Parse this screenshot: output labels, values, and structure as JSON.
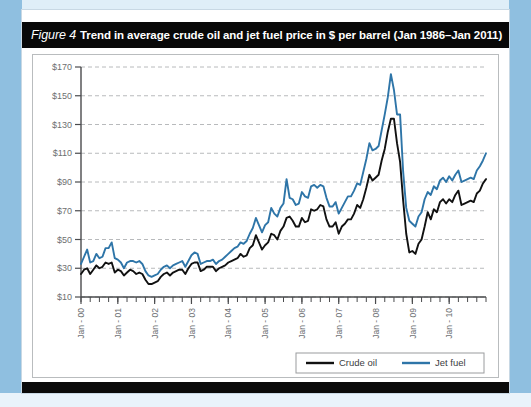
{
  "figure": {
    "number_label": "Figure 4",
    "title": "Trend in average crude oil and jet fuel price in $ per barrel (Jan 1986–Jan 2011)"
  },
  "colors": {
    "crude_oil": "#111111",
    "jet_fuel": "#2e75a8",
    "gridline": "#b8babc",
    "axis": "#4a4b4d",
    "tick_text": "#6d6f71",
    "header_band": "#080808",
    "page_background": "#8fbfe0"
  },
  "legend": {
    "position": "bottom-right",
    "entries": [
      {
        "name": "crude-oil",
        "label": "Crude oil",
        "color": "#111111"
      },
      {
        "name": "jet-fuel",
        "label": "Jet fuel",
        "color": "#2e75a8"
      }
    ]
  },
  "chart_data": {
    "type": "line",
    "title": "Trend in average crude oil and jet fuel price in $ per barrel (Jan 1986–Jan 2011)",
    "xlabel": "",
    "ylabel": "",
    "ylim": [
      10,
      170
    ],
    "ytick_values": [
      10,
      30,
      50,
      70,
      90,
      110,
      130,
      150,
      170
    ],
    "ytick_labels": [
      "$10",
      "$30",
      "$50",
      "$70",
      "$90",
      "$110",
      "$130",
      "$150",
      "$170"
    ],
    "grid": true,
    "grid_style": "dashed-horizontal",
    "x_start": "Jan-00",
    "x_end": "Jan-11",
    "x_step_months": 3,
    "xtick_labels": [
      "Jan - 00",
      "Jan - 01",
      "Jan - 02",
      "Jan - 03",
      "Jan - 04",
      "Jan - 05",
      "Jan - 06",
      "Jan - 07",
      "Jan - 08",
      "Jan - 09",
      "Jan - 10"
    ],
    "xtick_index": [
      0,
      12,
      24,
      36,
      48,
      60,
      72,
      84,
      96,
      108,
      120
    ],
    "x_months": 133,
    "series": [
      {
        "name": "Crude oil",
        "color": "#111111",
        "values": [
          26,
          29,
          30,
          26,
          29,
          32,
          30,
          31,
          34,
          33,
          34,
          27,
          29,
          28,
          25,
          27,
          29,
          28,
          26,
          27,
          26,
          22,
          19,
          19,
          20,
          21,
          24,
          26,
          27,
          25,
          27,
          28,
          29,
          29,
          26,
          30,
          33,
          34,
          34,
          28,
          29,
          31,
          31,
          31,
          28,
          30,
          31,
          32,
          34,
          35,
          36,
          37,
          40,
          38,
          39,
          44,
          46,
          53,
          48,
          43,
          46,
          48,
          54,
          53,
          50,
          56,
          59,
          65,
          66,
          63,
          59,
          59,
          65,
          62,
          63,
          71,
          70,
          71,
          74,
          73,
          64,
          59,
          59,
          62,
          54,
          59,
          61,
          64,
          64,
          68,
          74,
          72,
          78,
          86,
          95,
          91,
          93,
          95,
          105,
          113,
          125,
          134,
          134,
          117,
          104,
          77,
          54,
          41,
          42,
          40,
          47,
          50,
          59,
          69,
          64,
          71,
          69,
          76,
          78,
          75,
          78,
          76,
          81,
          84,
          74,
          75,
          76,
          77,
          76,
          82,
          84,
          89,
          92
        ]
      },
      {
        "name": "Jet fuel",
        "color": "#2e75a8",
        "values": [
          33,
          38,
          43,
          34,
          35,
          40,
          37,
          38,
          44,
          44,
          48,
          37,
          36,
          34,
          30,
          34,
          35,
          35,
          34,
          35,
          33,
          28,
          25,
          24,
          25,
          26,
          29,
          31,
          32,
          30,
          32,
          33,
          34,
          35,
          31,
          35,
          39,
          41,
          40,
          33,
          34,
          35,
          35,
          36,
          33,
          35,
          36,
          38,
          40,
          42,
          44,
          45,
          48,
          47,
          49,
          54,
          58,
          65,
          60,
          55,
          60,
          62,
          72,
          68,
          66,
          72,
          75,
          92,
          79,
          78,
          74,
          75,
          83,
          80,
          79,
          87,
          88,
          86,
          88,
          87,
          79,
          73,
          73,
          76,
          68,
          72,
          76,
          80,
          80,
          84,
          89,
          88,
          97,
          106,
          117,
          112,
          113,
          115,
          126,
          137,
          149,
          165,
          154,
          137,
          137,
          97,
          72,
          63,
          61,
          59,
          66,
          69,
          78,
          83,
          81,
          87,
          85,
          91,
          93,
          90,
          94,
          91,
          95,
          98,
          90,
          91,
          92,
          93,
          92,
          98,
          101,
          105,
          110
        ]
      }
    ]
  }
}
